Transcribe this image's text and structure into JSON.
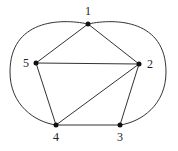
{
  "graph": {
    "nodes": [
      {
        "id": "1",
        "label": "1",
        "x": 88,
        "y": 24,
        "lx": 88,
        "ly": 15
      },
      {
        "id": "2",
        "label": "2",
        "x": 139,
        "y": 64,
        "lx": 150,
        "ly": 68
      },
      {
        "id": "3",
        "label": "3",
        "x": 120,
        "y": 125,
        "lx": 120,
        "ly": 141
      },
      {
        "id": "4",
        "label": "4",
        "x": 56,
        "y": 125,
        "lx": 56,
        "ly": 141
      },
      {
        "id": "5",
        "label": "5",
        "x": 36,
        "y": 63,
        "lx": 26,
        "ly": 67
      }
    ],
    "edges": [
      {
        "from": "1",
        "to": "5",
        "type": "straight"
      },
      {
        "from": "1",
        "to": "2",
        "type": "straight"
      },
      {
        "from": "5",
        "to": "2",
        "type": "straight"
      },
      {
        "from": "5",
        "to": "4",
        "type": "straight"
      },
      {
        "from": "4",
        "to": "2",
        "type": "straight"
      },
      {
        "from": "2",
        "to": "3",
        "type": "straight"
      },
      {
        "from": "4",
        "to": "3",
        "type": "straight"
      },
      {
        "from": "1",
        "to": "4",
        "type": "curved-left"
      },
      {
        "from": "1",
        "to": "3",
        "type": "curved-right"
      }
    ]
  }
}
